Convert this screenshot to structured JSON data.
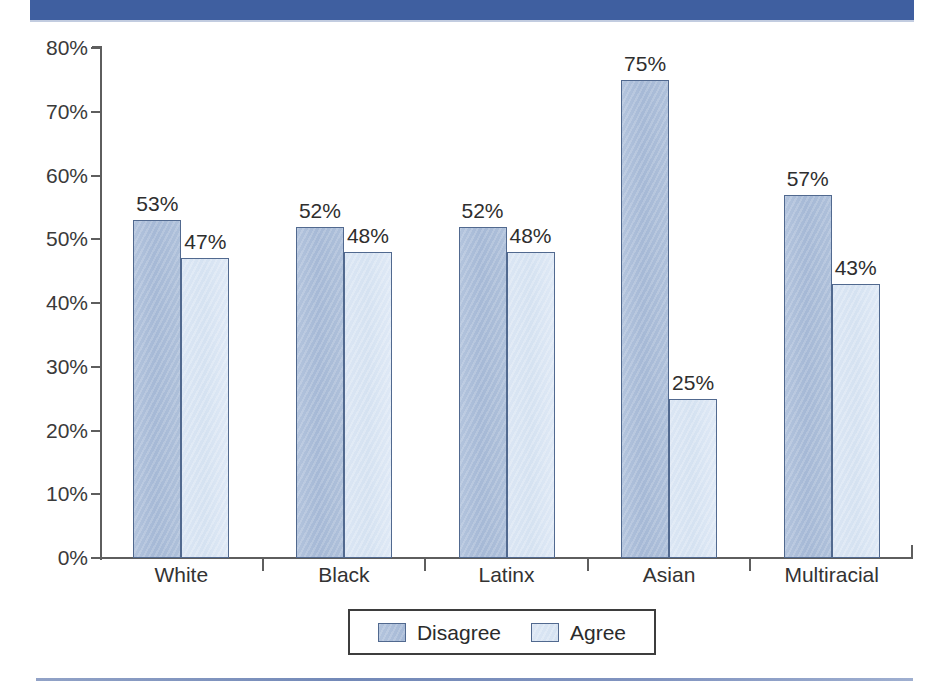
{
  "page": {
    "ghost_artifact_text": "                                                                            ",
    "top_rule_color": "#3f5fa0",
    "bottom_rule_color": "#5a74ab"
  },
  "chart_data": {
    "type": "bar",
    "title": "",
    "subtitle": "",
    "xlabel": "",
    "ylabel": "",
    "categories": [
      "White",
      "Black",
      "Latinx",
      "Asian",
      "Multiracial"
    ],
    "series": [
      {
        "name": "Disagree",
        "color": "#a6b9d6",
        "values": [
          53,
          52,
          52,
          75,
          57
        ]
      },
      {
        "name": "Agree",
        "color": "#d5e2f1",
        "values": [
          47,
          48,
          48,
          25,
          43
        ]
      }
    ],
    "value_labels": [
      [
        "53%",
        "52%",
        "52%",
        "75%",
        "57%"
      ],
      [
        "47%",
        "48%",
        "48%",
        "25%",
        "43%"
      ]
    ],
    "ylim": [
      0,
      80
    ],
    "ytick_values": [
      0,
      10,
      20,
      30,
      40,
      50,
      60,
      70,
      80
    ],
    "ytick_labels": [
      "0%",
      "10%",
      "20%",
      "30%",
      "40%",
      "50%",
      "60%",
      "70%",
      "80%"
    ],
    "grid": false,
    "legend_position": "bottom-center",
    "legend_entries": [
      "Disagree",
      "Agree"
    ],
    "units": "percent"
  }
}
